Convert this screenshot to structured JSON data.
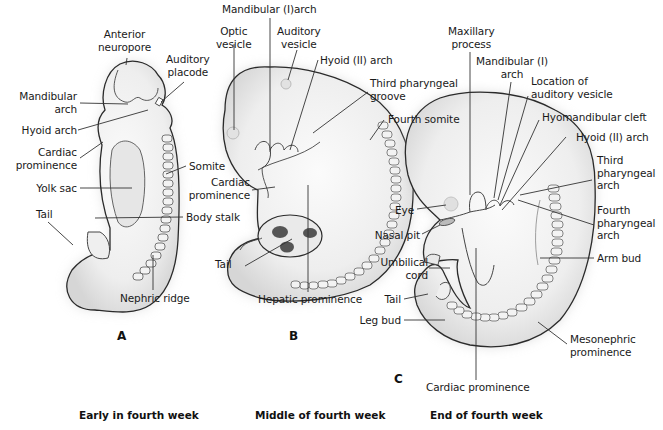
{
  "panels": [
    {
      "id": "A",
      "letter": "A",
      "caption": "Early in fourth week",
      "labels": {
        "anterior_neuropore": "Anterior\nneuropore",
        "auditory_placode": "Auditory\nplacode",
        "mandibular_arch": "Mandibular\narch",
        "hyoid_arch": "Hyoid arch",
        "cardiac_prominence": "Cardiac\nprominence",
        "somite": "Somite",
        "yolk_sac": "Yolk sac",
        "tail": "Tail",
        "body_stalk": "Body stalk",
        "nephric_ridge": "Nephric ridge"
      }
    },
    {
      "id": "B",
      "letter": "B",
      "caption": "Middle of fourth week",
      "labels": {
        "mandibular_arch": "Mandibular (I)arch",
        "optic_vesicle": "Optic\nvesicle",
        "auditory_vesicle": "Auditory\nvesicle",
        "hyoid_arch": "Hyoid (II) arch",
        "third_pharyngeal_groove": "Third pharyngeal\ngroove",
        "fourth_somite": "Fourth somite",
        "cardiac_prominence": "Cardiac\nprominence",
        "tail": "Tail",
        "hepatic_prominence": "Hepatic prominence"
      }
    },
    {
      "id": "C",
      "letter": "C",
      "caption": "End of fourth week",
      "labels": {
        "maxillary_process": "Maxillary\nprocess",
        "mandibular_arch": "Mandibular (I)\narch",
        "location_auditory_vesicle": "Location of\nauditory vesicle",
        "hyomandibular_cleft": "Hyomandibular cleft",
        "hyoid_arch": "Hyoid (II) arch",
        "third_pharyngeal_arch": "Third\npharyngeal\narch",
        "fourth_pharyngeal_arch": "Fourth\npharyngeal\narch",
        "arm_bud": "Arm bud",
        "eye": "Eye",
        "nasal_pit": "Nasal pit",
        "umbilical_cord": "Umbilical\ncord",
        "tail": "Tail",
        "leg_bud": "Leg bud",
        "mesonephric_prominence": "Mesonephric\nprominence",
        "cardiac_prominence": "Cardiac prominence"
      }
    }
  ],
  "colors": {
    "outline": "#2a2a2a",
    "fill": "#f2f2f2",
    "shade": "#d4d4d4",
    "leader": "#333333",
    "text": "#1a1a1a"
  }
}
